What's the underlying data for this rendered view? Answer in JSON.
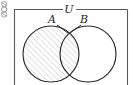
{
  "figure": {
    "type": "venn-diagram",
    "title": "",
    "universe_label": "U",
    "set_a_label": "A",
    "set_b_label": "B",
    "shaded_region": "A",
    "shading_style": "diagonal-hatch",
    "colors": {
      "stroke": "#2b2b2b",
      "hatch": "#b9b9b9",
      "background": "#ffffff",
      "universe_border": "#555555"
    },
    "geometry": {
      "universe_rect": {
        "x": 14,
        "y": 9,
        "width": 113,
        "height": 80
      },
      "circle_a": {
        "cx": 51,
        "cy": 54,
        "r": 28
      },
      "circle_b": {
        "cx": 88,
        "cy": 54,
        "r": 28
      },
      "label_u_pos": {
        "x": 69,
        "y": 9
      },
      "label_a_pos": {
        "x": 52,
        "y": 22
      },
      "label_b_pos": {
        "x": 84,
        "y": 22
      }
    },
    "leader_lines": [
      {
        "name": "leader-a",
        "x1": 57,
        "y1": 25,
        "x2": 68,
        "y2": 33
      },
      {
        "name": "leader-b",
        "x1": 81,
        "y1": 25,
        "x2": 70,
        "y2": 33
      }
    ],
    "corner_glyph": "page-corner-icon"
  }
}
